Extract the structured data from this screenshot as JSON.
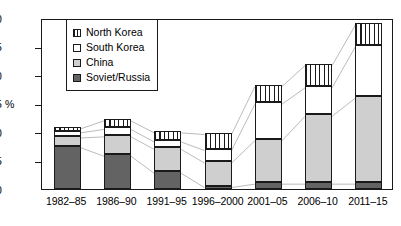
{
  "chart_data": {
    "type": "bar",
    "stacked": true,
    "title": "",
    "xlabel": "",
    "ylabel": "%",
    "ylim": [
      0,
      30
    ],
    "ytick_step": 5,
    "yticks": [
      "0",
      "5",
      "10",
      "15",
      "20",
      "25",
      "30"
    ],
    "grid": false,
    "legend_position": "inside-top-left",
    "categories": [
      "1982–85",
      "1986–90",
      "1991–95",
      "1996–2000",
      "2001–05",
      "2006–10",
      "2011–15"
    ],
    "series": [
      {
        "name": "Soviet/Russia",
        "color": "#636363",
        "pattern": "solid-dark",
        "values": [
          7.6,
          6.1,
          3.1,
          0.6,
          1.2,
          1.2,
          1.2
        ]
      },
      {
        "name": "China",
        "color": "#cfcfcf",
        "pattern": "solid-light",
        "values": [
          1.7,
          3.4,
          4.2,
          4.3,
          7.6,
          11.9,
          15.1
        ]
      },
      {
        "name": "South Korea",
        "color": "#ffffff",
        "pattern": "white",
        "values": [
          0.9,
          1.3,
          1.3,
          2.2,
          6.4,
          5.0,
          9.0
        ]
      },
      {
        "name": "North Korea",
        "color": "#ffffff",
        "pattern": "vertical-stripes",
        "values": [
          0.7,
          1.5,
          1.6,
          2.8,
          3.1,
          3.9,
          3.8
        ]
      }
    ],
    "totals": [
      10.9,
      12.3,
      10.2,
      9.9,
      18.3,
      22.0,
      29.1
    ],
    "connector_lines": true,
    "connector_color": "#b3b3b3"
  },
  "legend": {
    "items": [
      {
        "label": "North Korea",
        "swatch": "nkorea"
      },
      {
        "label": "South Korea",
        "swatch": "skorea"
      },
      {
        "label": "China",
        "swatch": "china"
      },
      {
        "label": "Soviet/Russia",
        "swatch": "soviet"
      }
    ]
  },
  "axis": {
    "y_title": "%"
  }
}
